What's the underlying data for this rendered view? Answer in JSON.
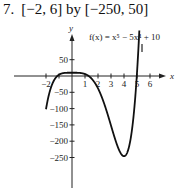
{
  "problem": {
    "number": "7.",
    "window": "[−2, 6] by [−250, 50]"
  },
  "chart_data": {
    "type": "line",
    "title": "",
    "function_label": "f(x) = x⁵ − 5x⁴ + 10",
    "xlabel": "x",
    "ylabel": "y",
    "xlim": [
      -2,
      6
    ],
    "ylim": [
      -250,
      50
    ],
    "x_ticks": [
      -2,
      -1,
      1,
      2,
      3,
      4,
      5,
      6
    ],
    "x_tick_labels": [
      "−2",
      "1",
      "2",
      "3",
      "4",
      "5",
      "6"
    ],
    "y_ticks": [
      50,
      -50,
      -100,
      -150,
      -200,
      -250
    ],
    "y_tick_labels": [
      "50",
      "−50",
      "−100",
      "−150",
      "−200",
      "−250"
    ],
    "grid": false,
    "series": [
      {
        "name": "f(x) = x^5 - 5x^4 + 10",
        "expression": "x^5 - 5x^4 + 10",
        "domain": [
          -2,
          6
        ],
        "color": "#111111"
      }
    ]
  }
}
